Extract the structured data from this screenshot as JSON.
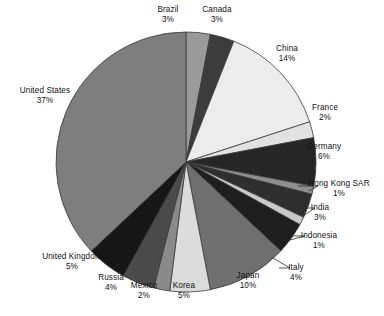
{
  "chart_data": {
    "type": "pie",
    "title": "",
    "subtitle": "",
    "xlabel": "",
    "ylabel": "",
    "legend": "none",
    "grid": false,
    "units": "percent",
    "start_angle_deg": 0,
    "direction": "clockwise",
    "categories": [
      "Brazil",
      "Canada",
      "China",
      "France",
      "Germany",
      "Hong Kong SAR",
      "India",
      "Indonesia",
      "Italy",
      "Japan",
      "Korea",
      "Mexico",
      "Russia",
      "United Kingdom",
      "United States"
    ],
    "values": [
      3,
      3,
      14,
      2,
      6,
      1,
      3,
      1,
      4,
      10,
      5,
      2,
      4,
      5,
      37
    ],
    "slices": [
      {
        "label": "Brazil",
        "value": 3,
        "percent_text": "3%",
        "color": "#9a9a9a",
        "label_pos": "top",
        "lx": 146,
        "ly": 5,
        "align": "c",
        "w": 44,
        "leader": null
      },
      {
        "label": "Canada",
        "value": 3,
        "percent_text": "3%",
        "color": "#3c3c3c",
        "label_pos": "top",
        "lx": 193,
        "ly": 5,
        "align": "c",
        "w": 48,
        "leader": null
      },
      {
        "label": "China",
        "value": 14,
        "percent_text": "14%",
        "color": "#ececec",
        "label_pos": "right-upper",
        "lx": 263,
        "ly": 44,
        "align": "c",
        "w": 48,
        "leader": null
      },
      {
        "label": "France",
        "value": 2,
        "percent_text": "2%",
        "color": "#e2e2e2",
        "label_pos": "right",
        "lx": 301,
        "ly": 103,
        "align": "c",
        "w": 48,
        "leader": null
      },
      {
        "label": "Germany",
        "value": 6,
        "percent_text": "6%",
        "color": "#262626",
        "label_pos": "right",
        "lx": 296,
        "ly": 142,
        "align": "c",
        "w": 56,
        "leader": null
      },
      {
        "label": "Hong Kong SAR",
        "value": 1,
        "percent_text": "1%",
        "color": "#8e8e8e",
        "label_pos": "right",
        "lx": 297,
        "ly": 179,
        "align": "c",
        "w": 84,
        "leader": [
          298,
          186,
          318,
          186,
          309,
          191
        ]
      },
      {
        "label": "India",
        "value": 3,
        "percent_text": "3%",
        "color": "#2e2e2e",
        "label_pos": "right",
        "lx": 300,
        "ly": 203,
        "align": "c",
        "w": 40,
        "leader": [
          302,
          208,
          315,
          208,
          303,
          216
        ]
      },
      {
        "label": "Indonesia",
        "value": 1,
        "percent_text": "1%",
        "color": "#c9c9c9",
        "label_pos": "right",
        "lx": 292,
        "ly": 231,
        "align": "c",
        "w": 54,
        "leader": [
          293,
          236,
          305,
          236,
          290,
          240
        ]
      },
      {
        "label": "Italy",
        "value": 4,
        "percent_text": "4%",
        "color": "#1e1e1e",
        "label_pos": "right-lower",
        "lx": 278,
        "ly": 263,
        "align": "c",
        "w": 36,
        "leader": [
          279,
          268,
          290,
          268,
          273,
          258
        ]
      },
      {
        "label": "Japan",
        "value": 10,
        "percent_text": "10%",
        "color": "#6f6f6f",
        "label_pos": "bottom-right",
        "lx": 226,
        "ly": 271,
        "align": "c",
        "w": 44,
        "leader": null
      },
      {
        "label": "Korea",
        "value": 5,
        "percent_text": "5%",
        "color": "#dcdcdc",
        "label_pos": "bottom",
        "lx": 164,
        "ly": 281,
        "align": "c",
        "w": 40,
        "leader": null
      },
      {
        "label": "Mexico",
        "value": 2,
        "percent_text": "2%",
        "color": "#8a8a8a",
        "label_pos": "bottom",
        "lx": 122,
        "ly": 281,
        "align": "c",
        "w": 44,
        "leader": null
      },
      {
        "label": "Russia",
        "value": 4,
        "percent_text": "4%",
        "color": "#4a4a4a",
        "label_pos": "bottom",
        "lx": 91,
        "ly": 273,
        "align": "c",
        "w": 40,
        "leader": null
      },
      {
        "label": "United Kingdom",
        "value": 5,
        "percent_text": "5%",
        "color": "#161616",
        "label_pos": "bottom-left",
        "lx": 29,
        "ly": 252,
        "align": "c",
        "w": 86,
        "leader": null
      },
      {
        "label": "United States",
        "value": 37,
        "percent_text": "37%",
        "color": "#7e7e7e",
        "label_pos": "left",
        "lx": 8,
        "ly": 86,
        "align": "c",
        "w": 74,
        "leader": null
      }
    ],
    "geometry": {
      "cx": 186,
      "cy": 162,
      "r": 130
    }
  }
}
